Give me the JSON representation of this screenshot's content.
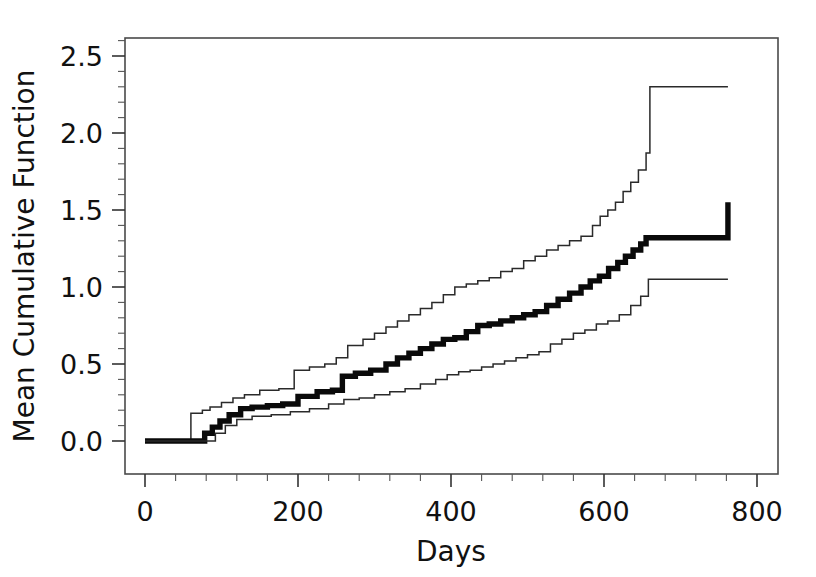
{
  "chart_data": {
    "type": "line",
    "title": "",
    "subtitle": "",
    "xlabel": "Days",
    "ylabel": "Mean Cumulative Function",
    "xlim": [
      -40,
      840
    ],
    "ylim": [
      -0.09,
      2.66
    ],
    "xticks": [
      0,
      200,
      400,
      600,
      800
    ],
    "xtick_labels": [
      "0",
      "200",
      "400",
      "600",
      "800"
    ],
    "yticks": [
      0.0,
      0.5,
      1.0,
      1.5,
      2.0,
      2.5
    ],
    "ytick_labels": [
      "0.0",
      "0.5",
      "1.0",
      "1.5",
      "2.0",
      "2.5"
    ],
    "x_minor_tick_step": 40,
    "y_minor_tick_step": 0.1,
    "grid": false,
    "legend": "none",
    "frame": "box",
    "style": "step-post",
    "series": [
      {
        "name": "Upper 95% confidence limit",
        "role": "upper-bound",
        "stroke": "#2a2a2a",
        "width": 1.5,
        "x": [
          0,
          55,
          60,
          75,
          85,
          100,
          115,
          130,
          150,
          175,
          195,
          215,
          235,
          250,
          265,
          285,
          300,
          315,
          330,
          345,
          360,
          375,
          390,
          405,
          420,
          435,
          450,
          465,
          480,
          495,
          510,
          525,
          540,
          555,
          570,
          585,
          595,
          605,
          615,
          625,
          635,
          645,
          655,
          660,
          762
        ],
        "y": [
          0.0,
          0.0,
          0.18,
          0.2,
          0.22,
          0.25,
          0.28,
          0.3,
          0.33,
          0.34,
          0.46,
          0.48,
          0.5,
          0.54,
          0.62,
          0.66,
          0.7,
          0.74,
          0.78,
          0.82,
          0.86,
          0.9,
          0.95,
          1.0,
          1.02,
          1.04,
          1.06,
          1.1,
          1.12,
          1.17,
          1.2,
          1.24,
          1.27,
          1.3,
          1.33,
          1.4,
          1.46,
          1.5,
          1.55,
          1.62,
          1.68,
          1.76,
          1.87,
          2.3,
          2.3
        ]
      },
      {
        "name": "Mean cumulative function (MCF) estimate",
        "role": "estimate",
        "stroke": "#0a0a0a",
        "width": 5.4,
        "x": [
          0,
          70,
          78,
          88,
          98,
          110,
          125,
          140,
          160,
          180,
          200,
          225,
          245,
          258,
          275,
          295,
          315,
          330,
          345,
          360,
          375,
          390,
          405,
          420,
          435,
          450,
          465,
          480,
          495,
          510,
          525,
          540,
          555,
          570,
          582,
          594,
          606,
          618,
          628,
          638,
          648,
          655,
          762
        ],
        "y": [
          0.0,
          0.0,
          0.05,
          0.09,
          0.13,
          0.17,
          0.21,
          0.22,
          0.23,
          0.24,
          0.29,
          0.32,
          0.33,
          0.42,
          0.44,
          0.46,
          0.5,
          0.54,
          0.57,
          0.6,
          0.63,
          0.66,
          0.67,
          0.71,
          0.75,
          0.76,
          0.78,
          0.8,
          0.82,
          0.84,
          0.88,
          0.92,
          0.96,
          1.0,
          1.04,
          1.07,
          1.12,
          1.16,
          1.2,
          1.24,
          1.28,
          1.32,
          1.55
        ]
      },
      {
        "name": "Lower 95% confidence limit",
        "role": "lower-bound",
        "stroke": "#2a2a2a",
        "width": 1.5,
        "x": [
          0,
          80,
          92,
          105,
          120,
          140,
          165,
          190,
          215,
          240,
          260,
          280,
          300,
          320,
          340,
          360,
          380,
          395,
          410,
          425,
          440,
          455,
          470,
          485,
          500,
          515,
          530,
          545,
          560,
          575,
          590,
          605,
          620,
          635,
          648,
          658,
          762
        ],
        "y": [
          0.0,
          0.0,
          0.05,
          0.1,
          0.14,
          0.16,
          0.17,
          0.19,
          0.21,
          0.24,
          0.27,
          0.28,
          0.3,
          0.32,
          0.34,
          0.37,
          0.4,
          0.43,
          0.45,
          0.46,
          0.48,
          0.5,
          0.52,
          0.54,
          0.56,
          0.58,
          0.63,
          0.66,
          0.7,
          0.72,
          0.76,
          0.78,
          0.82,
          0.88,
          0.94,
          1.05,
          1.05
        ]
      }
    ],
    "annotations": [],
    "plot_area_px": {
      "left": 125,
      "right": 778,
      "top": 38,
      "bottom": 474
    },
    "final_values": {
      "upper": 2.3,
      "estimate": 1.55,
      "lower": 1.05,
      "max_day": 762
    }
  }
}
